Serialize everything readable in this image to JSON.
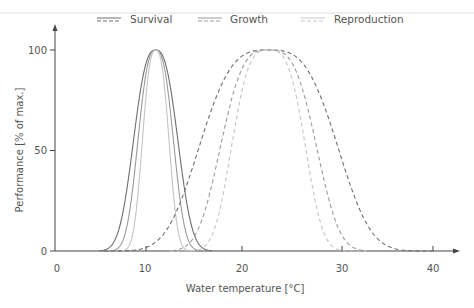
{
  "chart_data": {
    "type": "line",
    "title": "",
    "xlabel": "Water temperature [°C]",
    "ylabel": "Performance [% of max.]",
    "xlim": [
      0,
      40
    ],
    "ylim": [
      0,
      100
    ],
    "xticks": [
      0,
      10,
      20,
      30,
      40
    ],
    "yticks": [
      0,
      50,
      100
    ],
    "grid": false,
    "legend_position": "top",
    "legend": [
      {
        "label": "Survival",
        "color": "#6e6e6e"
      },
      {
        "label": "Growth",
        "color": "#9a9a9a"
      },
      {
        "label": "Reproduction",
        "color": "#c4c4c4"
      }
    ],
    "line_styles": {
      "cold_water_species": "solid",
      "warm_water_species": "dashed"
    },
    "series": [
      {
        "name": "Survival",
        "group": "cold",
        "style": "solid",
        "color": "#6e6e6e",
        "center": 10.5,
        "half_width": 2.5,
        "sharpness": 2.6,
        "x": [
          4.5,
          6,
          7,
          7.6,
          8.5,
          9.5,
          10.5,
          11.5,
          12.5,
          13.4,
          14,
          15,
          16.5
        ],
        "y": [
          0,
          2,
          15,
          50,
          85,
          98,
          100,
          98,
          85,
          50,
          15,
          2,
          0
        ]
      },
      {
        "name": "Growth",
        "group": "cold",
        "style": "solid",
        "color": "#9a9a9a",
        "center": 10.5,
        "half_width": 2.0,
        "sharpness": 2.6,
        "x": [
          5.5,
          7,
          7.8,
          8.5,
          9.3,
          10.5,
          11.7,
          12.5,
          13.2,
          14,
          15.5
        ],
        "y": [
          0,
          2,
          15,
          50,
          88,
          100,
          88,
          50,
          15,
          2,
          0
        ]
      },
      {
        "name": "Reproduction",
        "group": "cold",
        "style": "solid",
        "color": "#c4c4c4",
        "center": 10.5,
        "half_width": 1.5,
        "sharpness": 2.6,
        "x": [
          6.5,
          8,
          8.6,
          9.0,
          9.7,
          10.5,
          11.3,
          12.0,
          12.4,
          13,
          14.5
        ],
        "y": [
          0,
          2,
          15,
          50,
          88,
          100,
          88,
          50,
          15,
          2,
          0
        ]
      },
      {
        "name": "Survival",
        "group": "warm",
        "style": "dashed",
        "color": "#6e6e6e",
        "center": 22.5,
        "half_width": 7.5,
        "sharpness": 3.2,
        "x": [
          5,
          9,
          12,
          15,
          18,
          22.5,
          27,
          30,
          33,
          36,
          40
        ],
        "y": [
          0,
          2,
          12,
          50,
          92,
          100,
          92,
          50,
          12,
          2,
          0
        ]
      },
      {
        "name": "Growth",
        "group": "warm",
        "style": "dashed",
        "color": "#9a9a9a",
        "center": 22.5,
        "half_width": 5.2,
        "sharpness": 3.2,
        "x": [
          10,
          13,
          15.5,
          17.3,
          19.5,
          22.5,
          25.5,
          27.7,
          29.5,
          32,
          35
        ],
        "y": [
          0,
          2,
          12,
          50,
          92,
          100,
          92,
          50,
          12,
          2,
          0
        ]
      },
      {
        "name": "Reproduction",
        "group": "warm",
        "style": "dashed",
        "color": "#c4c4c4",
        "center": 22.5,
        "half_width": 4.0,
        "sharpness": 3.2,
        "x": [
          12,
          15,
          17,
          18.5,
          20.3,
          22.5,
          24.7,
          26.5,
          28,
          30,
          33
        ],
        "y": [
          0,
          2,
          12,
          50,
          92,
          100,
          92,
          50,
          12,
          2,
          0
        ]
      }
    ]
  },
  "legend": {
    "survival": "Survival",
    "growth": "Growth",
    "reproduction": "Reproduction"
  },
  "axes": {
    "x_label": "Water temperature [°C]",
    "y_label": "Performance [% of max.]",
    "x_ticks": [
      "0",
      "10",
      "20",
      "30",
      "40"
    ],
    "y_ticks": [
      "0",
      "50",
      "100"
    ]
  }
}
